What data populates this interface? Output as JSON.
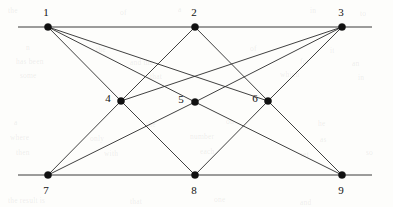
{
  "diagram": {
    "type": "node-link-graph",
    "canvas": {
      "width": 393,
      "height": 207
    },
    "colors": {
      "background": "#fdfdfb",
      "edge": "#2a2a2a",
      "axis": "#3a3a3a",
      "vertex": "#111111",
      "label": "#111111"
    },
    "axis_lines": [
      {
        "name": "top-rule",
        "x1": 18,
        "y1": 27,
        "x2": 372,
        "y2": 27
      },
      {
        "name": "bottom-rule",
        "x1": 18,
        "y1": 175,
        "x2": 372,
        "y2": 175
      }
    ],
    "nodes": [
      {
        "id": "1",
        "label": "1",
        "x": 48,
        "y": 27,
        "label_x": 46,
        "label_y": 13,
        "row": "top"
      },
      {
        "id": "2",
        "label": "2",
        "x": 195,
        "y": 27,
        "label_x": 194,
        "label_y": 13,
        "row": "top"
      },
      {
        "id": "3",
        "label": "3",
        "x": 342,
        "y": 27,
        "label_x": 341,
        "label_y": 13,
        "row": "top"
      },
      {
        "id": "4",
        "label": "4",
        "x": 121,
        "y": 101,
        "label_x": 108,
        "label_y": 99,
        "row": "middle"
      },
      {
        "id": "5",
        "label": "5",
        "x": 195,
        "y": 102,
        "label_x": 181,
        "label_y": 100,
        "row": "middle"
      },
      {
        "id": "6",
        "label": "6",
        "x": 268,
        "y": 101,
        "label_x": 255,
        "label_y": 99,
        "row": "middle"
      },
      {
        "id": "7",
        "label": "7",
        "x": 48,
        "y": 175,
        "label_x": 46,
        "label_y": 191,
        "row": "bottom"
      },
      {
        "id": "8",
        "label": "8",
        "x": 195,
        "y": 175,
        "label_x": 194,
        "label_y": 191,
        "row": "bottom"
      },
      {
        "id": "9",
        "label": "9",
        "x": 342,
        "y": 175,
        "label_x": 341,
        "label_y": 191,
        "row": "bottom"
      }
    ],
    "edges": [
      {
        "from": "1",
        "to": "4"
      },
      {
        "from": "1",
        "to": "5"
      },
      {
        "from": "1",
        "to": "6"
      },
      {
        "from": "2",
        "to": "4"
      },
      {
        "from": "2",
        "to": "6"
      },
      {
        "from": "3",
        "to": "4"
      },
      {
        "from": "3",
        "to": "5"
      },
      {
        "from": "3",
        "to": "6"
      },
      {
        "from": "4",
        "to": "7"
      },
      {
        "from": "4",
        "to": "8"
      },
      {
        "from": "5",
        "to": "7"
      },
      {
        "from": "5",
        "to": "9"
      },
      {
        "from": "6",
        "to": "8"
      },
      {
        "from": "6",
        "to": "9"
      }
    ],
    "vertex_radius": 3.6,
    "edge_count": 14,
    "node_count": 9
  },
  "background_ghosts": [
    {
      "text": "the",
      "x": 8,
      "y": 6
    },
    {
      "text": "of",
      "x": 120,
      "y": 8
    },
    {
      "text": "a",
      "x": 178,
      "y": 5
    },
    {
      "text": "in",
      "x": 310,
      "y": 6
    },
    {
      "text": "to",
      "x": 360,
      "y": 9
    },
    {
      "text": "n",
      "x": 26,
      "y": 43
    },
    {
      "text": "the",
      "x": 96,
      "y": 45
    },
    {
      "text": "of",
      "x": 250,
      "y": 44
    },
    {
      "text": "it",
      "x": 330,
      "y": 46
    },
    {
      "text": "has been",
      "x": 16,
      "y": 57
    },
    {
      "text": "and the",
      "x": 130,
      "y": 58
    },
    {
      "text": "for",
      "x": 300,
      "y": 57
    },
    {
      "text": "an",
      "x": 352,
      "y": 59
    },
    {
      "text": "some",
      "x": 20,
      "y": 71
    },
    {
      "text": "that",
      "x": 150,
      "y": 72
    },
    {
      "text": "which",
      "x": 280,
      "y": 70
    },
    {
      "text": "in",
      "x": 358,
      "y": 73
    },
    {
      "text": "a",
      "x": 14,
      "y": 118
    },
    {
      "text": "the",
      "x": 146,
      "y": 120
    },
    {
      "text": "on",
      "x": 226,
      "y": 117
    },
    {
      "text": "he",
      "x": 318,
      "y": 119
    },
    {
      "text": "where",
      "x": 10,
      "y": 133
    },
    {
      "text": "only",
      "x": 90,
      "y": 134
    },
    {
      "text": "number",
      "x": 190,
      "y": 132
    },
    {
      "text": "as",
      "x": 320,
      "y": 135
    },
    {
      "text": "then",
      "x": 16,
      "y": 148
    },
    {
      "text": "with",
      "x": 104,
      "y": 149
    },
    {
      "text": "each",
      "x": 200,
      "y": 147
    },
    {
      "text": "set",
      "x": 300,
      "y": 150
    },
    {
      "text": "so",
      "x": 366,
      "y": 148
    },
    {
      "text": "the result is",
      "x": 8,
      "y": 196
    },
    {
      "text": "that",
      "x": 130,
      "y": 197
    },
    {
      "text": "one",
      "x": 214,
      "y": 195
    },
    {
      "text": "and",
      "x": 300,
      "y": 198
    }
  ]
}
